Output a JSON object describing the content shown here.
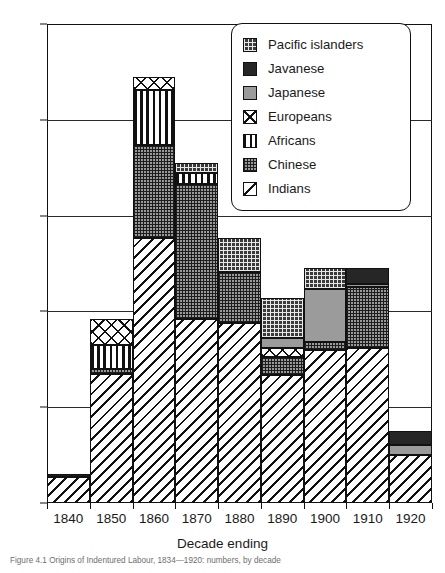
{
  "chart_data": {
    "type": "bar",
    "subtype": "stacked",
    "title": "",
    "xlabel": "Decade ending",
    "ylabel": "",
    "ylim": [
      0,
      500
    ],
    "yticks": [
      0,
      100,
      200,
      300,
      400,
      500
    ],
    "grid": true,
    "legend_position": "top-right",
    "categories": [
      "1840",
      "1850",
      "1860",
      "1870",
      "1880",
      "1890",
      "1900",
      "1910",
      "1920"
    ],
    "series": [
      {
        "name": "Indians",
        "key": "indians",
        "values": [
          27,
          135,
          277,
          192,
          188,
          134,
          160,
          162,
          50
        ]
      },
      {
        "name": "Chinese",
        "key": "chinese",
        "values": [
          3,
          5,
          97,
          141,
          53,
          18,
          8,
          63,
          0
        ]
      },
      {
        "name": "Africans",
        "key": "africans",
        "values": [
          0,
          25,
          57,
          11,
          0,
          0,
          0,
          0,
          0
        ]
      },
      {
        "name": "Europeans",
        "key": "europeans",
        "values": [
          0,
          27,
          14,
          0,
          0,
          10,
          0,
          0,
          0
        ]
      },
      {
        "name": "Japanese",
        "key": "japanese",
        "values": [
          0,
          0,
          0,
          0,
          0,
          10,
          55,
          4,
          11
        ]
      },
      {
        "name": "Javanese",
        "key": "javanese",
        "values": [
          0,
          0,
          0,
          0,
          0,
          0,
          0,
          16,
          14
        ]
      },
      {
        "name": "Pacific islanders",
        "key": "pacific",
        "values": [
          0,
          0,
          0,
          11,
          36,
          42,
          22,
          0,
          0
        ]
      }
    ],
    "totals": [
      30,
      192,
      445,
      355,
      277,
      214,
      245,
      245,
      75
    ],
    "stack_order": [
      "indians",
      "chinese",
      "africans",
      "europeans",
      "japanese",
      "javanese",
      "pacific"
    ]
  },
  "legend": {
    "items": [
      {
        "label": "Pacific islanders",
        "key": "pacific"
      },
      {
        "label": "Javanese",
        "key": "javanese"
      },
      {
        "label": "Japanese",
        "key": "japanese"
      },
      {
        "label": "Europeans",
        "key": "europeans"
      },
      {
        "label": "Africans",
        "key": "africans"
      },
      {
        "label": "Chinese",
        "key": "chinese"
      },
      {
        "label": "Indians",
        "key": "indians"
      }
    ]
  },
  "axis": {
    "x_title": "Decade ending",
    "y_ticks": [
      "500",
      "400",
      "300",
      "200",
      "100",
      "0"
    ]
  },
  "caption": "Figure 4.1  Origins of Indentured Labour, 1834—1920: numbers, by decade"
}
